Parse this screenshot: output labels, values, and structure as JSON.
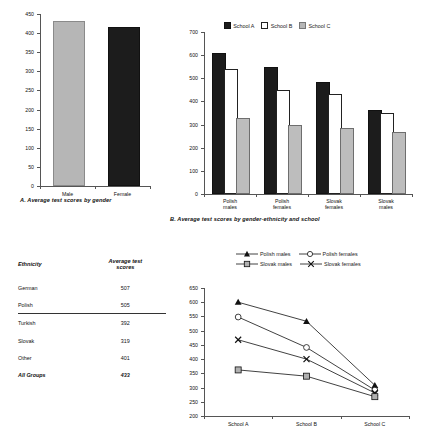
{
  "chart_data": [
    {
      "id": "A",
      "type": "bar",
      "title": "",
      "caption": "A. Average test scores by gender",
      "categories": [
        "Male",
        "Female"
      ],
      "values": [
        427,
        412
      ],
      "colors": [
        "#b6b6b6",
        "#1c1c1c"
      ],
      "xlabel": "",
      "ylabel": "",
      "ylim": [
        0,
        450
      ],
      "yticks": [
        0,
        50,
        100,
        150,
        200,
        250,
        300,
        350,
        400,
        450
      ],
      "grid": false,
      "legend": "none"
    },
    {
      "id": "B",
      "type": "bar",
      "title": "",
      "caption": "B. Average test scores by gender-ethnicity and school",
      "categories": [
        "Polish males",
        "Polish females",
        "Slovak females",
        "Slovak males"
      ],
      "series": [
        {
          "name": "School A",
          "color": "#1c1c1c",
          "values": [
            600,
            540,
            475,
            355
          ]
        },
        {
          "name": "School B",
          "color": "#ffffff",
          "values": [
            530,
            440,
            425,
            340
          ]
        },
        {
          "name": "School C",
          "color": "#b6b6b6",
          "values": [
            320,
            288,
            278,
            258
          ]
        }
      ],
      "xlabel": "",
      "ylabel": "",
      "ylim": [
        0,
        700
      ],
      "yticks": [
        0,
        100,
        200,
        300,
        400,
        500,
        600,
        700
      ],
      "grid": false,
      "legend": "top-center"
    },
    {
      "id": "C",
      "type": "line",
      "title": "",
      "caption": "",
      "categories": [
        "School A",
        "School B",
        "School C"
      ],
      "series": [
        {
          "name": "Polish males",
          "marker": "filled-triangle",
          "values": [
            600,
            533,
            308
          ]
        },
        {
          "name": "Polish females",
          "marker": "open-circle",
          "values": [
            548,
            441,
            291
          ]
        },
        {
          "name": "Slovak females",
          "marker": "x-cross",
          "values": [
            468,
            400,
            281
          ]
        },
        {
          "name": "Slovak males",
          "marker": "gray-square",
          "values": [
            362,
            340,
            268
          ]
        }
      ],
      "xlabel": "",
      "ylabel": "",
      "ylim": [
        200,
        650
      ],
      "yticks": [
        200,
        250,
        300,
        350,
        400,
        450,
        500,
        550,
        600,
        650
      ],
      "grid": false,
      "legend": "top-center"
    }
  ],
  "chartA": {
    "caption": "A. Average test scores by gender",
    "yticks": [
      "450",
      "400",
      "350",
      "300",
      "250",
      "200",
      "150",
      "100",
      "50",
      "0"
    ],
    "xticks": [
      "Male",
      "Female"
    ]
  },
  "chartB": {
    "caption": "B. Average test scores by gender-ethnicity and school",
    "legend": [
      "School A",
      "School B",
      "School C"
    ],
    "yticks": [
      "700",
      "600",
      "500",
      "400",
      "300",
      "200",
      "100",
      "0"
    ],
    "xticks": [
      {
        "line1": "Polish",
        "line2": "males"
      },
      {
        "line1": "Polish",
        "line2": "females"
      },
      {
        "line1": "Slovak",
        "line2": "females"
      },
      {
        "line1": "Slovak",
        "line2": "males"
      }
    ]
  },
  "chartC": {
    "legend": [
      "Polish males",
      "Polish females",
      "Slovak males",
      "Slovak females"
    ],
    "yticks": [
      "650",
      "600",
      "550",
      "500",
      "450",
      "400",
      "350",
      "300",
      "250",
      "200"
    ],
    "xticks": [
      "School A",
      "School B",
      "School C"
    ]
  },
  "table": {
    "headers": [
      "Ethnicity",
      "Average test",
      "scores"
    ],
    "rows": [
      {
        "ethnicity": "German",
        "score": "507"
      },
      {
        "ethnicity": "Polish",
        "score": "505"
      },
      {
        "ethnicity": "Turkish",
        "score": "392"
      },
      {
        "ethnicity": "Slovak",
        "score": "319"
      },
      {
        "ethnicity": "Other",
        "score": "401"
      },
      {
        "ethnicity": "All Groups",
        "score": "433"
      }
    ]
  }
}
